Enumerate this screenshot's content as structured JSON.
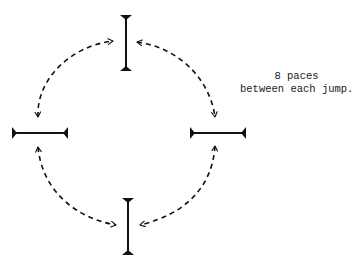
{
  "diagram": {
    "title": "",
    "note": {
      "line1": "8 paces",
      "line2": "between each jump."
    },
    "colors": {
      "ink": "#111111",
      "background": "#ffffff"
    },
    "nodes": [
      {
        "id": "hurdle-top",
        "orientation": "vertical",
        "label": ""
      },
      {
        "id": "hurdle-left",
        "orientation": "horizontal",
        "label": ""
      },
      {
        "id": "hurdle-right",
        "orientation": "horizontal",
        "label": ""
      },
      {
        "id": "hurdle-bottom",
        "orientation": "vertical",
        "label": ""
      }
    ],
    "edges": [
      {
        "from": "hurdle-left",
        "to": "hurdle-top",
        "style": "dashed",
        "direction": "both"
      },
      {
        "from": "hurdle-top",
        "to": "hurdle-right",
        "style": "dashed",
        "direction": "both"
      },
      {
        "from": "hurdle-left",
        "to": "hurdle-bottom",
        "style": "dashed",
        "direction": "both"
      },
      {
        "from": "hurdle-right",
        "to": "hurdle-bottom",
        "style": "dashed",
        "direction": "both"
      }
    ]
  }
}
